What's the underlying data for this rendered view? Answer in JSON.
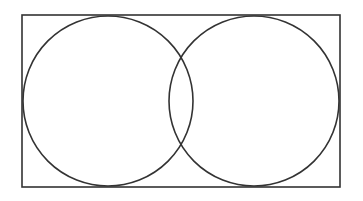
{
  "diagram": {
    "type": "venn",
    "background": "#ffffff",
    "stroke_color": "#333333",
    "stroke_width": 1.6,
    "universe": {
      "shape": "rectangle",
      "x": 22,
      "y": 15,
      "width": 318,
      "height": 172,
      "label": ""
    },
    "sets": [
      {
        "id": "A",
        "label": "",
        "cx": 108,
        "cy": 101,
        "r": 85
      },
      {
        "id": "B",
        "label": "",
        "cx": 254,
        "cy": 101,
        "r": 85
      }
    ]
  }
}
